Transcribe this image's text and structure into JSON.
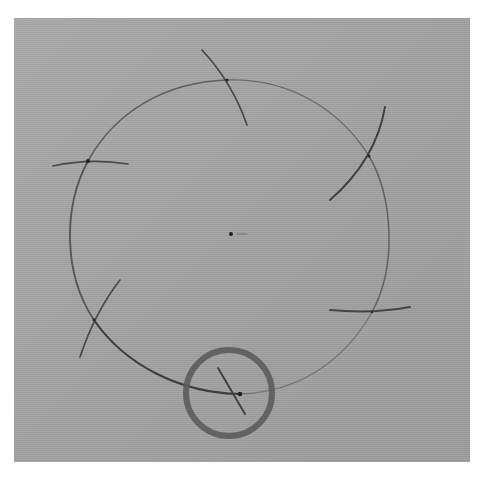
{
  "figure": {
    "colors": {
      "page_background": "#ffffff",
      "paper": "#a3a3a3",
      "pencil": "#3a3a3a",
      "highlight_ring": "#5e5e5e"
    },
    "circle": {
      "cx": 231,
      "cy": 237,
      "rx": 162,
      "ry": 158
    },
    "center_point": {
      "x": 231,
      "y": 234
    },
    "center_tick": {
      "x1": 237,
      "y1": 234,
      "x2": 247,
      "y2": 234
    },
    "division_points": [
      {
        "label": "top",
        "x": 227,
        "y": 80
      },
      {
        "label": "upper-right",
        "x": 369,
        "y": 156
      },
      {
        "label": "lower-right",
        "x": 372,
        "y": 312
      },
      {
        "label": "bottom",
        "x": 240,
        "y": 394
      },
      {
        "label": "lower-left",
        "x": 94,
        "y": 320
      },
      {
        "label": "upper-left",
        "x": 88,
        "y": 161
      }
    ],
    "highlight": {
      "cx": 229,
      "cy": 393,
      "r": 43,
      "stroke_width": 6
    },
    "caption": "Circle divided with compass arcs; the last arc intersection is circled"
  }
}
